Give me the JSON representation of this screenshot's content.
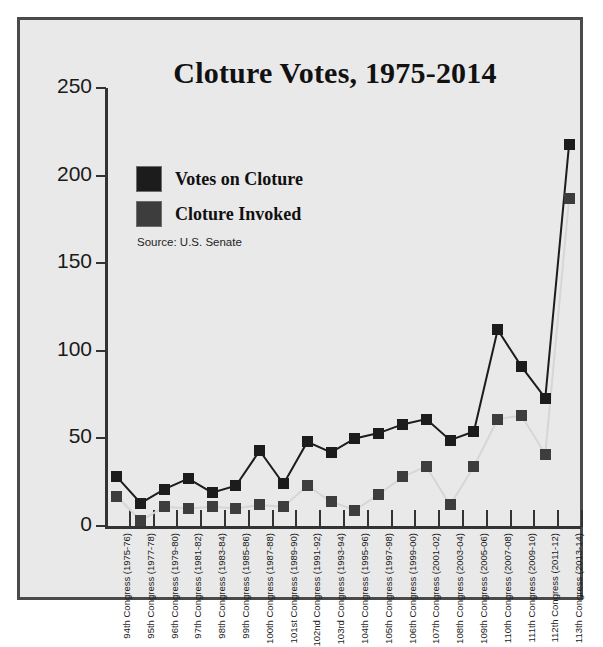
{
  "chart_data": {
    "type": "line",
    "title": "Cloture Votes, 1975-2014",
    "xlabel": "",
    "ylabel": "",
    "ylim": [
      0,
      250
    ],
    "yticks": [
      0,
      50,
      100,
      150,
      200,
      250
    ],
    "grid": false,
    "legend_position": "upper-left",
    "source": "Source: U.S. Senate",
    "categories": [
      "94th Congress (1975-76)",
      "95th Congress (1977-78)",
      "96th Congress (1979-80)",
      "97th Congress (1981-82)",
      "98th Congress (1983-84)",
      "99th Congress (1985-86)",
      "100th Congress (1987-88)",
      "101st Congress (1989-90)",
      "102nd Congress (1991-92)",
      "103rd Congress (1993-94)",
      "104th Congress (1995-96)",
      "105th Congress (1997-98)",
      "106th Congress (1999-00)",
      "107th Congress (2001-02)",
      "108th Congress (2003-04)",
      "109th Congress (2005-06)",
      "110th Congress (2007-08)",
      "111th Congress (2009-10)",
      "112th Congress (2011-12)",
      "113th Congress (2013-14)"
    ],
    "series": [
      {
        "name": "Votes on Cloture",
        "color": "#1c1c1c",
        "values": [
          28,
          13,
          21,
          27,
          19,
          23,
          43,
          24,
          48,
          42,
          50,
          53,
          58,
          61,
          49,
          54,
          112,
          91,
          73,
          218
        ]
      },
      {
        "name": "Cloture Invoked",
        "color": "#3d3d3d",
        "values": [
          17,
          3,
          11,
          10,
          11,
          10,
          12,
          11,
          23,
          14,
          9,
          18,
          28,
          34,
          12,
          34,
          61,
          63,
          41,
          187
        ]
      }
    ]
  },
  "legend": {
    "items": [
      {
        "label": "Votes on Cloture",
        "color": "#1c1c1c"
      },
      {
        "label": "Cloture Invoked",
        "color": "#3d3d3d"
      }
    ]
  },
  "axis": {
    "y_labels": [
      "250",
      "200",
      "150",
      "100",
      "50",
      "0"
    ]
  }
}
